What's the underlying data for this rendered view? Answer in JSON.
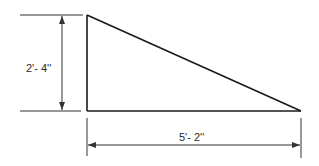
{
  "diagram": {
    "type": "dimensioned-right-triangle",
    "shape": {
      "name": "right triangle",
      "right_angle_corner": "bottom-left",
      "stroke_color": "#1a1a1a"
    },
    "dimensions": {
      "height": {
        "label": "2'- 4''",
        "orientation": "vertical",
        "side": "left"
      },
      "width": {
        "label": "5'- 2''",
        "orientation": "horizontal",
        "side": "bottom"
      }
    },
    "colors": {
      "background": "#ffffff",
      "line": "#1a1a1a",
      "dimension_line": "#333333",
      "text": "#2a2a2a"
    }
  }
}
